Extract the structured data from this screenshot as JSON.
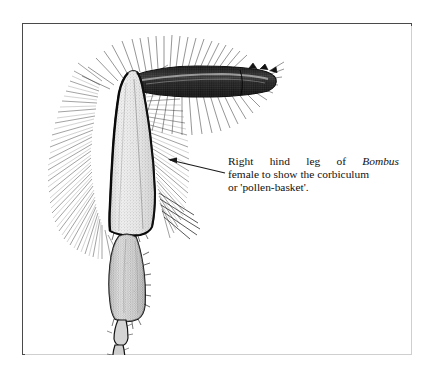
{
  "plate": {
    "frame_color": "#4a4a4a",
    "background": "#ffffff",
    "ink_color": "#1a1a1a"
  },
  "figure": {
    "parts": [
      {
        "name": "femur",
        "label": "femur"
      },
      {
        "name": "tibia-corbicula",
        "label": "tibia (corbiculum)"
      },
      {
        "name": "basitarsus",
        "label": "basitarsus"
      },
      {
        "name": "tarsal-segments",
        "label": "tarsal segments"
      },
      {
        "name": "claw",
        "label": "claw"
      },
      {
        "name": "hair-fringe",
        "label": "hair fringe"
      }
    ]
  },
  "pointer": {
    "name": "pointer-arrow",
    "direction": "left",
    "tip_x": 168,
    "tip_y": 160,
    "tail_x": 225,
    "tail_y": 173
  },
  "caption": {
    "line1_a": "Right",
    "line1_b": "hind",
    "line1_c": "leg",
    "line1_d": "of",
    "line1_e": "Bombus",
    "line2": "female to show the corbiculum",
    "line3": "or 'pollen-basket'."
  }
}
